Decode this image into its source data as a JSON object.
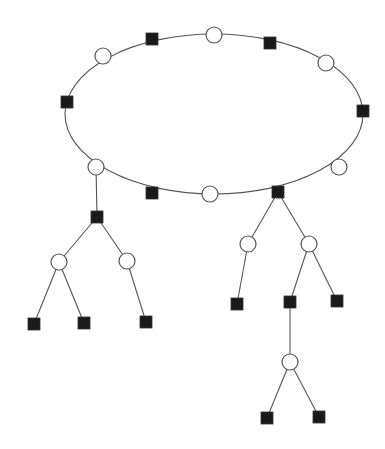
{
  "diagram": {
    "type": "cactus-graph / cycle with attached trees",
    "style": {
      "background": "#ffffff",
      "line_color": "#555555",
      "filled_node_color": "#1a1a1a",
      "open_node_fill": "#ffffff"
    },
    "cycle": {
      "cx": 214,
      "cy": 114,
      "rx": 149,
      "ry": 80
    },
    "node_size": {
      "circle_radius": 8,
      "square_side": 12
    },
    "nodes": [
      {
        "id": "c1",
        "shape": "circle",
        "x": 103,
        "y": 56
      },
      {
        "id": "s1",
        "shape": "square",
        "x": 152,
        "y": 39
      },
      {
        "id": "c2",
        "shape": "circle",
        "x": 214,
        "y": 35
      },
      {
        "id": "s2",
        "shape": "square",
        "x": 270,
        "y": 43
      },
      {
        "id": "c3",
        "shape": "circle",
        "x": 326,
        "y": 63
      },
      {
        "id": "s3",
        "shape": "square",
        "x": 363,
        "y": 111
      },
      {
        "id": "c4",
        "shape": "circle",
        "x": 339,
        "y": 167
      },
      {
        "id": "s4",
        "shape": "square",
        "x": 278,
        "y": 192
      },
      {
        "id": "c5",
        "shape": "circle",
        "x": 210,
        "y": 194
      },
      {
        "id": "s5",
        "shape": "square",
        "x": 152,
        "y": 193
      },
      {
        "id": "c6",
        "shape": "circle",
        "x": 96,
        "y": 167
      },
      {
        "id": "s6",
        "shape": "square",
        "x": 67,
        "y": 102
      },
      {
        "id": "s7",
        "shape": "square",
        "x": 97,
        "y": 217
      },
      {
        "id": "c7",
        "shape": "circle",
        "x": 59,
        "y": 262
      },
      {
        "id": "c8",
        "shape": "circle",
        "x": 127,
        "y": 261
      },
      {
        "id": "s8",
        "shape": "square",
        "x": 34,
        "y": 324
      },
      {
        "id": "s9",
        "shape": "square",
        "x": 84,
        "y": 323
      },
      {
        "id": "s10",
        "shape": "square",
        "x": 146,
        "y": 322
      },
      {
        "id": "c9",
        "shape": "circle",
        "x": 248,
        "y": 244
      },
      {
        "id": "c10",
        "shape": "circle",
        "x": 309,
        "y": 244
      },
      {
        "id": "s11",
        "shape": "square",
        "x": 237,
        "y": 304
      },
      {
        "id": "s12",
        "shape": "square",
        "x": 290,
        "y": 302
      },
      {
        "id": "s13",
        "shape": "square",
        "x": 337,
        "y": 301
      },
      {
        "id": "c11",
        "shape": "circle",
        "x": 290,
        "y": 362
      },
      {
        "id": "s14",
        "shape": "square",
        "x": 267,
        "y": 418
      },
      {
        "id": "s15",
        "shape": "square",
        "x": 319,
        "y": 417
      }
    ],
    "edges": [
      [
        "c6",
        "s7"
      ],
      [
        "s7",
        "c7"
      ],
      [
        "s7",
        "c8"
      ],
      [
        "c7",
        "s8"
      ],
      [
        "c7",
        "s9"
      ],
      [
        "c8",
        "s10"
      ],
      [
        "s4",
        "c9"
      ],
      [
        "s4",
        "c10"
      ],
      [
        "c9",
        "s11"
      ],
      [
        "c10",
        "s12"
      ],
      [
        "c10",
        "s13"
      ],
      [
        "s12",
        "c11"
      ],
      [
        "c11",
        "s14"
      ],
      [
        "c11",
        "s15"
      ]
    ]
  }
}
